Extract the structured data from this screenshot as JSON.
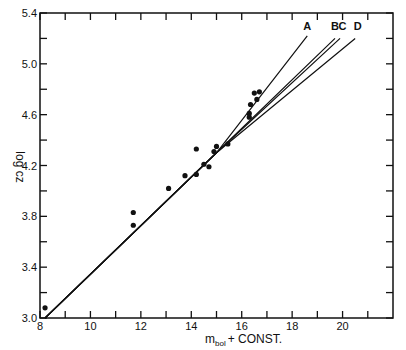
{
  "chart_data": {
    "type": "scatter",
    "title": "",
    "xlabel": "m_bol + CONST.",
    "xlabel_main": "m",
    "xlabel_sub": "bol",
    "xlabel_rest": "+ CONST.",
    "ylabel": "log cz",
    "xlim": [
      8,
      22
    ],
    "ylim": [
      3.0,
      5.4
    ],
    "x_ticks": [
      8,
      9,
      10,
      11,
      12,
      13,
      14,
      15,
      16,
      17,
      18,
      19,
      20,
      21
    ],
    "x_tick_labels": [
      "8",
      "10",
      "12",
      "14",
      "16",
      "18",
      "20"
    ],
    "y_ticks": [
      3.0,
      3.2,
      3.4,
      3.6,
      3.8,
      4.0,
      4.2,
      4.4,
      4.6,
      4.8,
      5.0,
      5.2,
      5.4
    ],
    "y_tick_labels": [
      "3.0",
      "3.4",
      "3.8",
      "4.2",
      "4.6",
      "5.0",
      "5.4"
    ],
    "grid": false,
    "legend": "none",
    "points": {
      "name": "observed",
      "x": [
        8.2,
        11.7,
        11.7,
        13.1,
        13.75,
        14.2,
        14.2,
        14.5,
        14.7,
        14.9,
        15.0,
        15.45,
        16.3,
        16.3,
        16.35,
        16.6,
        16.5,
        16.7
      ],
      "y": [
        3.08,
        3.73,
        3.83,
        4.02,
        4.12,
        4.13,
        4.33,
        4.21,
        4.19,
        4.31,
        4.35,
        4.37,
        4.58,
        4.61,
        4.68,
        4.72,
        4.77,
        4.78
      ]
    },
    "series": [
      {
        "name": "A",
        "x": [
          8.2,
          15.0,
          18.6
        ],
        "y": [
          3.0,
          4.3,
          5.22
        ]
      },
      {
        "name": "B",
        "x": [
          8.2,
          15.0,
          19.7
        ],
        "y": [
          3.0,
          4.3,
          5.2
        ]
      },
      {
        "name": "C",
        "x": [
          8.2,
          15.0,
          19.9
        ],
        "y": [
          3.0,
          4.3,
          5.2
        ]
      },
      {
        "name": "D",
        "x": [
          8.2,
          15.0,
          20.5
        ],
        "y": [
          3.0,
          4.3,
          5.2
        ]
      }
    ],
    "annotations": [
      {
        "text": "A",
        "x": 18.6,
        "y": 5.27
      },
      {
        "text": "B",
        "x": 19.7,
        "y": 5.27
      },
      {
        "text": "C",
        "x": 20.0,
        "y": 5.27
      },
      {
        "text": "D",
        "x": 20.6,
        "y": 5.27
      }
    ]
  }
}
